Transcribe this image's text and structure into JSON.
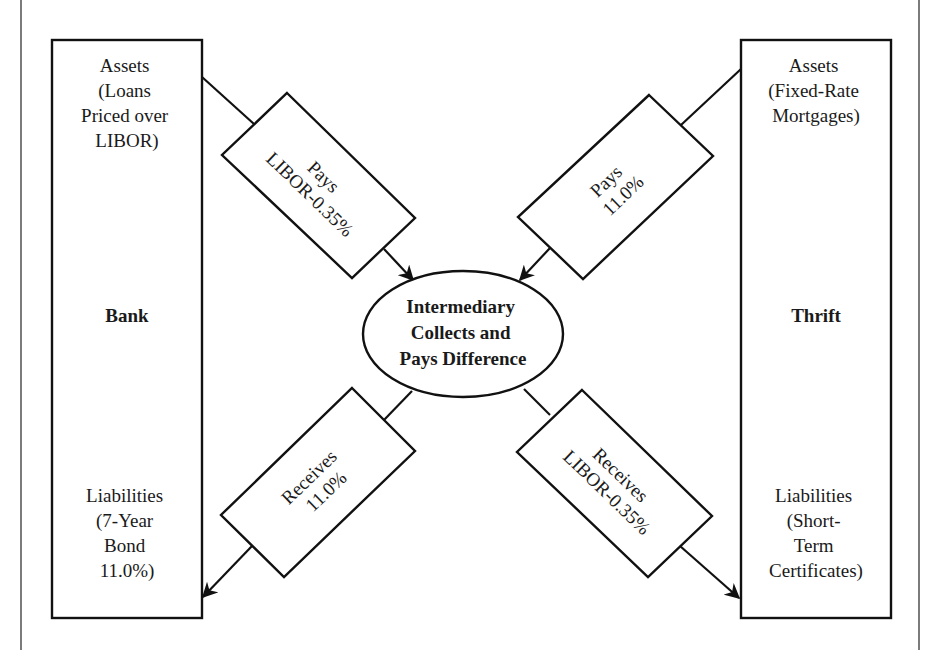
{
  "bank": {
    "title": "Bank",
    "assets": [
      "Assets",
      "(Loans",
      "Priced over",
      "LIBOR)"
    ],
    "liabilities": [
      "Liabilities",
      "(7-Year",
      "Bond",
      "11.0%)"
    ]
  },
  "thrift": {
    "title": "Thrift",
    "assets": [
      "Assets",
      "(Fixed-Rate",
      "Mortgages)"
    ],
    "liabilities": [
      "Liabilities",
      "(Short-",
      "Term",
      "Certificates)"
    ]
  },
  "intermediary": {
    "lines": [
      "Intermediary",
      "Collects and",
      "Pays Difference"
    ]
  },
  "flows": {
    "bank_pays": [
      "Pays",
      "LIBOR-0.35%"
    ],
    "thrift_pays": [
      "Pays",
      "11.0%"
    ],
    "bank_receives": [
      "Receives",
      "11.0%"
    ],
    "thrift_receives": [
      "Receives",
      "LIBOR-0.35%"
    ]
  },
  "colors": {
    "line": "#111111",
    "background": "#ffffff"
  }
}
